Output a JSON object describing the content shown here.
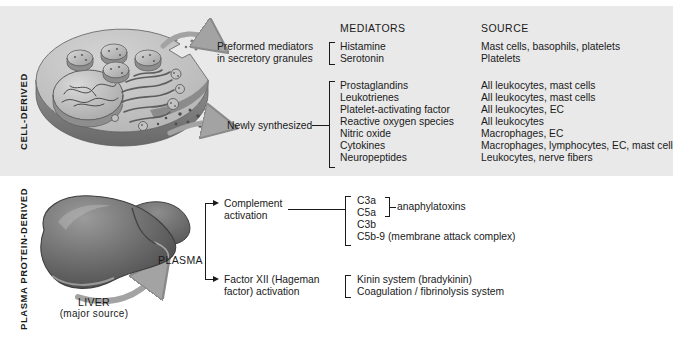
{
  "figure": {
    "side_labels": {
      "cell_derived": "CELL-DERIVED",
      "plasma_protein_derived": "PLASMA PROTEIN-DERIVED"
    },
    "columns": {
      "mediators": "MEDIATORS",
      "source": "SOURCE"
    }
  },
  "cell_panel": {
    "illustration_name": "cut-away-cell",
    "groups": [
      {
        "label_line1": "Preformed mediators",
        "label_line2": "in secretory granules",
        "rows": [
          {
            "mediator": "Histamine",
            "source": "Mast cells, basophils, platelets"
          },
          {
            "mediator": "Serotonin",
            "source": "Platelets"
          }
        ]
      },
      {
        "label_line1": "Newly synthesized",
        "label_line2": "",
        "rows": [
          {
            "mediator": "Prostaglandins",
            "source": "All leukocytes, mast cells"
          },
          {
            "mediator": "Leukotrienes",
            "source": "All leukocytes, mast cells"
          },
          {
            "mediator": "Platelet-activating factor",
            "source": "All leukocytes, EC"
          },
          {
            "mediator": "Reactive oxygen species",
            "source": "All leukocytes"
          },
          {
            "mediator": "Nitric oxide",
            "source": "Macrophages, EC"
          },
          {
            "mediator": "Cytokines",
            "source": "Macrophages, lymphocytes, EC, mast cells"
          },
          {
            "mediator": "Neuropeptides",
            "source": "Leukocytes, nerve fibers"
          }
        ]
      }
    ]
  },
  "plasma_panel": {
    "illustration_name": "liver",
    "liver_caption_line1": "LIVER",
    "liver_caption_line2": "(major source)",
    "plasma_label": "PLASMA",
    "groups": [
      {
        "label_line1": "Complement",
        "label_line2": "activation",
        "items": [
          "C3a",
          "C5a",
          "C3b",
          "C5b-9 (membrane attack complex)"
        ],
        "sub_bracket_label": "anaphylatoxins"
      },
      {
        "label_line1": "Factor XII (Hageman",
        "label_line2": "factor) activation",
        "items": [
          "Kinin system (bradykinin)",
          "Coagulation / fibrinolysis system"
        ],
        "sub_bracket_label": ""
      }
    ]
  },
  "colors": {
    "panel_background": "#e9e9e9",
    "text": "#1a1a1a",
    "arrow_grey": "#9a9a9a",
    "liver_grey": "#6e6e6e"
  }
}
